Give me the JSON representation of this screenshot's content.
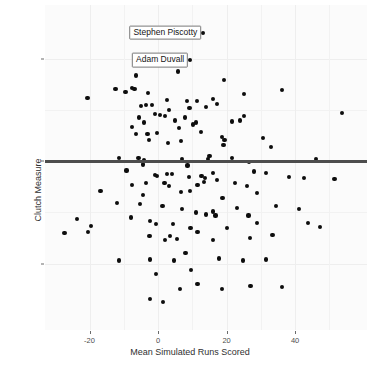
{
  "chart_data": {
    "type": "scatter",
    "title": "",
    "xlabel": "Mean Simulated Runs Scored",
    "ylabel": "Clutch Measure",
    "xlim": [
      -33,
      61
    ],
    "ylim": [
      -16.5,
      15.3
    ],
    "xticks": [
      -20,
      0,
      20,
      40
    ],
    "xtick_labels": [
      "-20",
      "0",
      "20",
      "40"
    ],
    "yticks": [
      10,
      0,
      -10
    ],
    "ytick_labels": [
      "10",
      "0",
      "-10"
    ],
    "grid": true,
    "legend": "none",
    "reference_line": {
      "type": "hline",
      "y": 0,
      "color": "#4d4d4d",
      "width": 3
    },
    "point_color": "#0d0d0d",
    "panel_background": "#fbfbfb",
    "annotations": [
      {
        "label": "Stephen Piscotty",
        "x": 13.2,
        "y": 12.6
      },
      {
        "label": "Adam Duvall",
        "x": 9.4,
        "y": 9.9
      }
    ],
    "points": [
      [
        13.2,
        12.6
      ],
      [
        9.4,
        9.9
      ],
      [
        -6.4,
        8.4
      ],
      [
        -12.4,
        7.1
      ],
      [
        -9.5,
        6.8
      ],
      [
        -7.6,
        7.2
      ],
      [
        -6.9,
        7.1
      ],
      [
        -20.6,
        6.2
      ],
      [
        -2.9,
        6.7
      ],
      [
        5.8,
        8.8
      ],
      [
        2.6,
        6.0
      ],
      [
        8.5,
        5.9
      ],
      [
        11.4,
        5.9
      ],
      [
        19.3,
        8.0
      ],
      [
        16.1,
        6.1
      ],
      [
        25.2,
        6.6
      ],
      [
        36.2,
        7.0
      ],
      [
        -4.9,
        5.4
      ],
      [
        -3.6,
        5.5
      ],
      [
        -1.8,
        5.5
      ],
      [
        -1.0,
        4.6
      ],
      [
        -5.6,
        4.3
      ],
      [
        -4.2,
        3.8
      ],
      [
        -7.7,
        3.4
      ],
      [
        -6.5,
        2.7
      ],
      [
        -3.1,
        2.7
      ],
      [
        -0.4,
        2.8
      ],
      [
        0.6,
        4.5
      ],
      [
        2.1,
        4.4
      ],
      [
        3.2,
        5.0
      ],
      [
        5.0,
        4.0
      ],
      [
        6.2,
        3.3
      ],
      [
        7.9,
        4.3
      ],
      [
        9.2,
        5.2
      ],
      [
        10.3,
        3.6
      ],
      [
        11.1,
        3.8
      ],
      [
        12.6,
        2.9
      ],
      [
        14.1,
        5.3
      ],
      [
        17.3,
        5.6
      ],
      [
        18.6,
        2.4
      ],
      [
        19.4,
        2.1
      ],
      [
        19.1,
        1.6
      ],
      [
        21.5,
        3.9
      ],
      [
        24.0,
        4.0
      ],
      [
        25.1,
        4.4
      ],
      [
        30.6,
        2.3
      ],
      [
        33.0,
        1.4
      ],
      [
        53.6,
        4.7
      ],
      [
        2.9,
        1.8
      ],
      [
        6.8,
        2.0
      ],
      [
        -2.7,
        2.1
      ],
      [
        -11.5,
        0.3
      ],
      [
        -5.7,
        0.3
      ],
      [
        -4.2,
        0.1
      ],
      [
        -4.3,
        -0.3
      ],
      [
        7.0,
        0.2
      ],
      [
        8.6,
        -0.4
      ],
      [
        14.6,
        0.2
      ],
      [
        15.0,
        0.5
      ],
      [
        21.5,
        0.3
      ],
      [
        26.6,
        -0.1
      ],
      [
        46.0,
        0.2
      ],
      [
        -9.2,
        -0.9
      ],
      [
        -1.0,
        -1.3
      ],
      [
        -0.2,
        -1.4
      ],
      [
        2.5,
        -1.2
      ],
      [
        4.0,
        -1.2
      ],
      [
        9.0,
        -1.5
      ],
      [
        12.7,
        -1.4
      ],
      [
        13.7,
        -1.6
      ],
      [
        16.0,
        -1.1
      ],
      [
        17.1,
        -1.8
      ],
      [
        27.9,
        -1.0
      ],
      [
        31.6,
        -1.1
      ],
      [
        38.2,
        -1.5
      ],
      [
        42.6,
        -1.6
      ],
      [
        51.5,
        -1.7
      ],
      [
        -7.7,
        -2.3
      ],
      [
        -3.4,
        -2.1
      ],
      [
        1.9,
        -2.1
      ],
      [
        3.2,
        -2.4
      ],
      [
        11.5,
        -2.3
      ],
      [
        13.5,
        -2.0
      ],
      [
        22.5,
        -2.1
      ],
      [
        26.0,
        -2.4
      ],
      [
        -16.8,
        -2.9
      ],
      [
        -4.3,
        -3.3
      ],
      [
        6.6,
        -3.0
      ],
      [
        9.4,
        -2.9
      ],
      [
        18.8,
        -3.6
      ],
      [
        28.9,
        -3.1
      ],
      [
        -11.9,
        -4.1
      ],
      [
        -5.3,
        -4.2
      ],
      [
        1.3,
        -4.4
      ],
      [
        6.9,
        -4.7
      ],
      [
        11.0,
        -5.0
      ],
      [
        13.9,
        -5.2
      ],
      [
        16.1,
        -4.9
      ],
      [
        16.8,
        -5.3
      ],
      [
        23.0,
        -4.6
      ],
      [
        26.4,
        -5.3
      ],
      [
        34.4,
        -4.4
      ],
      [
        41.2,
        -4.7
      ],
      [
        -23.7,
        -5.6
      ],
      [
        -8.0,
        -5.5
      ],
      [
        -2.3,
        -5.8
      ],
      [
        -0.6,
        -6.1
      ],
      [
        4.3,
        -6.1
      ],
      [
        9.5,
        -6.5
      ],
      [
        11.5,
        -6.9
      ],
      [
        20.1,
        -6.5
      ],
      [
        29.0,
        -6.0
      ],
      [
        43.8,
        -6.0
      ],
      [
        47.2,
        -6.4
      ],
      [
        -27.3,
        -7.0
      ],
      [
        -20.4,
        -6.9
      ],
      [
        -19.5,
        -6.3
      ],
      [
        -2.5,
        -7.3
      ],
      [
        2.0,
        -7.7
      ],
      [
        3.6,
        -7.3
      ],
      [
        5.5,
        -7.6
      ],
      [
        16.1,
        -7.7
      ],
      [
        26.9,
        -7.5
      ],
      [
        33.4,
        -7.2
      ],
      [
        -11.5,
        -9.7
      ],
      [
        -2.4,
        -9.6
      ],
      [
        4.6,
        -9.7
      ],
      [
        8.0,
        -9.0
      ],
      [
        17.9,
        -9.5
      ],
      [
        24.9,
        -9.7
      ],
      [
        31.6,
        -9.6
      ],
      [
        -0.5,
        -11.0
      ],
      [
        9.7,
        -10.6
      ],
      [
        6.3,
        -12.5
      ],
      [
        11.5,
        -12.0
      ],
      [
        18.7,
        -12.5
      ],
      [
        27.0,
        -12.2
      ],
      [
        36.1,
        -12.3
      ],
      [
        -2.3,
        -13.5
      ],
      [
        1.5,
        -13.8
      ]
    ]
  }
}
